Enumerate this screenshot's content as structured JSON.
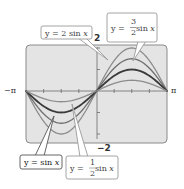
{
  "chart_data": {
    "type": "line",
    "title": "",
    "xlabel": "",
    "ylabel": "",
    "xlim": [
      -3.14159,
      3.14159
    ],
    "ylim": [
      -2.3,
      2.3
    ],
    "x_tick_labels": [
      "−π",
      "π"
    ],
    "y_tick_labels": [
      "2",
      "−2"
    ],
    "grid": false,
    "series": [
      {
        "name": "y = 2 sin x",
        "amplitude": 2,
        "color": "#8c8c8c",
        "width": 1.3
      },
      {
        "name": "y = 3/2 sin x",
        "amplitude": 1.5,
        "color": "#6e6e6e",
        "width": 1.3
      },
      {
        "name": "y = sin x",
        "amplitude": 1,
        "color": "#3a3a3a",
        "width": 1.8
      },
      {
        "name": "y = 1/2 sin x",
        "amplitude": 0.5,
        "color": "#8c8c8c",
        "width": 1.3
      }
    ]
  },
  "labels": {
    "x_min": "−π",
    "x_max": "π",
    "y_max": "2",
    "y_min": "−2"
  },
  "callouts": {
    "two_sin": {
      "prefix": "y = 2 sin ",
      "var": "x"
    },
    "three_halves_sin": {
      "prefix": "y = ",
      "num": "3",
      "den": "2",
      "suffix": " sin ",
      "var": "x"
    },
    "sin": {
      "prefix": "y = sin ",
      "var": "x"
    },
    "half_sin": {
      "prefix": "y = ",
      "num": "1",
      "den": "2",
      "suffix": " sin ",
      "var": "x"
    }
  }
}
